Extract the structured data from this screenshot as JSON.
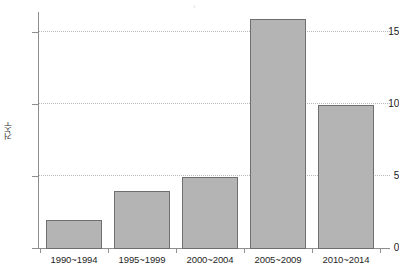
{
  "chart_data": {
    "type": "bar",
    "title": "",
    "xlabel": "",
    "ylabel": "건수",
    "categories": [
      "1990~1994",
      "1995~1999",
      "2000~2004",
      "2005~2009",
      "2010~2014"
    ],
    "values": [
      2,
      4,
      5,
      16,
      10
    ],
    "series": [
      {
        "name": "건수",
        "values": [
          2,
          4,
          5,
          16,
          10
        ]
      }
    ],
    "ylim": [
      0,
      16.6
    ],
    "y_ticks": [
      0,
      5,
      10,
      15
    ],
    "y_tick_labels": [
      "0",
      "5",
      "10",
      "15"
    ],
    "grid": true,
    "gridlines_at": [
      5,
      10,
      15
    ],
    "legend": false,
    "legend_position": "none",
    "bar_fill_color": "#b4b4b4",
    "bar_border_color": "#6f6f6f",
    "axis_color": "#8e8e8e",
    "gridline_color": "#b9b9b9",
    "background_color": "#ffffff"
  },
  "axis": {
    "y_title": "건수",
    "ticks": [
      {
        "label": "15",
        "value": 15
      },
      {
        "label": "10",
        "value": 10
      },
      {
        "label": "5",
        "value": 5
      },
      {
        "label": "0",
        "value": 0
      }
    ]
  },
  "bars": [
    {
      "category": "1990~1994",
      "value": 2
    },
    {
      "category": "1995~1999",
      "value": 4
    },
    {
      "category": "2000~2004",
      "value": 5
    },
    {
      "category": "2005~2009",
      "value": 16
    },
    {
      "category": "2010~2014",
      "value": 10
    }
  ]
}
